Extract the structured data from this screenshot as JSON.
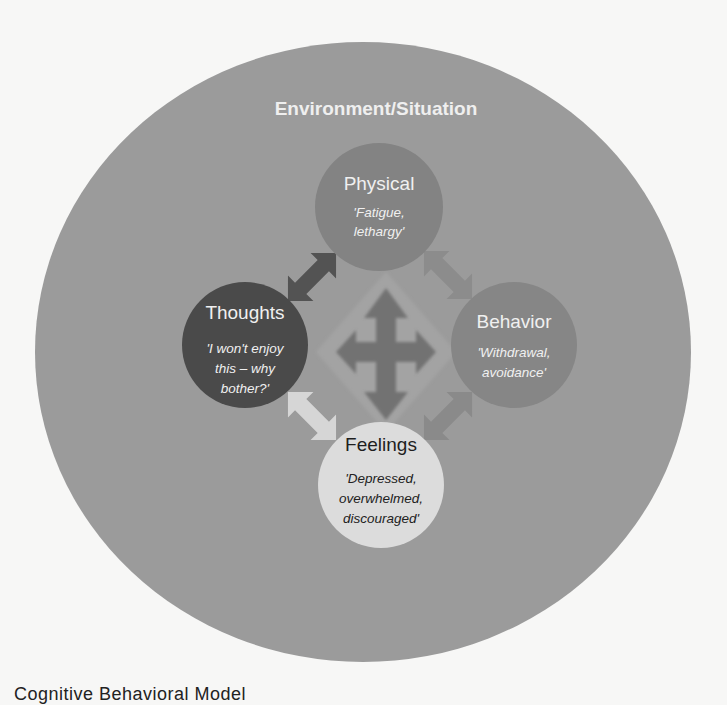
{
  "diagram": {
    "environment": {
      "title": "Environment/Situation",
      "color": "#9b9b9b"
    },
    "nodes": {
      "physical": {
        "title": "Physical",
        "quote_lines": [
          "'Fatigue,",
          "lethargy'"
        ],
        "color": "#838383"
      },
      "thoughts": {
        "title": "Thoughts",
        "quote_lines": [
          "'I won't enjoy",
          "this – why",
          "bother?'"
        ],
        "color": "#4a4a4a"
      },
      "behavior": {
        "title": "Behavior",
        "quote_lines": [
          "'Withdrawal,",
          "avoidance'"
        ],
        "color": "#868686"
      },
      "feelings": {
        "title": "Feelings",
        "quote_lines": [
          "'Depressed,",
          "overwhelmed,",
          "discouraged'"
        ],
        "color": "#dcdcdc"
      }
    },
    "arrows": [
      {
        "name": "thoughts-physical",
        "icon": "double-arrow-icon",
        "color": "#535353"
      },
      {
        "name": "physical-behavior",
        "icon": "double-arrow-icon",
        "color": "#8c8c8c"
      },
      {
        "name": "behavior-feelings",
        "icon": "double-arrow-icon",
        "color": "#8a8a8a"
      },
      {
        "name": "thoughts-feelings",
        "icon": "double-arrow-icon",
        "color": "#d6d6d6"
      },
      {
        "name": "center",
        "icon": "four-way-arrow-icon",
        "color": "#727272"
      }
    ]
  },
  "caption": "Cognitive Behavioral Model"
}
